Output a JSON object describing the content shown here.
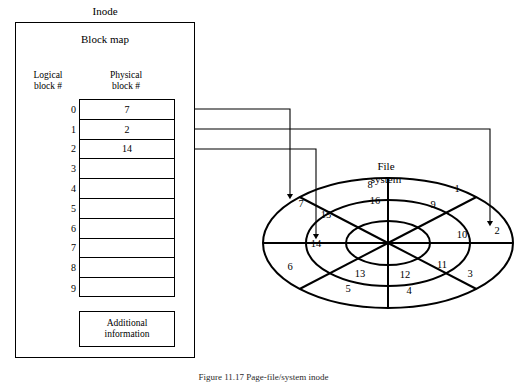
{
  "figure": {
    "inode_title": "Inode",
    "block_map_title": "Block map",
    "logical_header": "Logical\nblock #",
    "logical_header_line1": "Logical",
    "logical_header_line2": "block #",
    "physical_header_line1": "Physical",
    "physical_header_line2": "block #",
    "additional_info_line1": "Additional",
    "additional_info_line2": "information",
    "file_system_line1": "File",
    "file_system_line2": "system",
    "caption": "Figure 11.17  Page-file/system inode",
    "line_color": "#000000",
    "background": "#ffffff"
  },
  "block_map": {
    "rows": [
      {
        "logical": "0",
        "physical": "7"
      },
      {
        "logical": "1",
        "physical": "2"
      },
      {
        "logical": "2",
        "physical": "14"
      },
      {
        "logical": "3",
        "physical": ""
      },
      {
        "logical": "4",
        "physical": ""
      },
      {
        "logical": "5",
        "physical": ""
      },
      {
        "logical": "6",
        "physical": ""
      },
      {
        "logical": "7",
        "physical": ""
      },
      {
        "logical": "8",
        "physical": ""
      },
      {
        "logical": "9",
        "physical": ""
      }
    ]
  },
  "disk": {
    "rings": [
      {
        "name": "outer",
        "labels": [
          "1",
          "2",
          "3",
          "4",
          "5",
          "6",
          "7",
          "8"
        ]
      },
      {
        "name": "middle",
        "labels": [
          "9",
          "10",
          "11",
          "12",
          "13",
          "14",
          "15",
          "16"
        ]
      },
      {
        "name": "inner",
        "labels": []
      }
    ],
    "sector_count": 8,
    "outer_numbers": [
      {
        "value": "1",
        "x": 457,
        "y": 190
      },
      {
        "value": "2",
        "x": 497,
        "y": 232
      },
      {
        "value": "3",
        "x": 470,
        "y": 275
      },
      {
        "value": "4",
        "x": 409,
        "y": 292
      },
      {
        "value": "5",
        "x": 348,
        "y": 290
      },
      {
        "value": "6",
        "x": 290,
        "y": 268
      },
      {
        "value": "7",
        "x": 301,
        "y": 205
      },
      {
        "value": "8",
        "x": 370,
        "y": 186
      }
    ],
    "middle_numbers": [
      {
        "value": "9",
        "x": 433,
        "y": 206
      },
      {
        "value": "10",
        "x": 462,
        "y": 236
      },
      {
        "value": "11",
        "x": 442,
        "y": 266
      },
      {
        "value": "12",
        "x": 405,
        "y": 276
      },
      {
        "value": "13",
        "x": 360,
        "y": 275
      },
      {
        "value": "14",
        "x": 316,
        "y": 245
      },
      {
        "value": "15",
        "x": 326,
        "y": 216
      },
      {
        "value": "16",
        "x": 375,
        "y": 202
      }
    ]
  },
  "connectors": [
    {
      "name": "logical-0-to-physical-7",
      "source_row": "0",
      "target_label": "7"
    },
    {
      "name": "logical-1-to-physical-2",
      "source_row": "1",
      "target_label": "2"
    },
    {
      "name": "logical-2-to-physical-14",
      "source_row": "2",
      "target_label": "14"
    }
  ]
}
